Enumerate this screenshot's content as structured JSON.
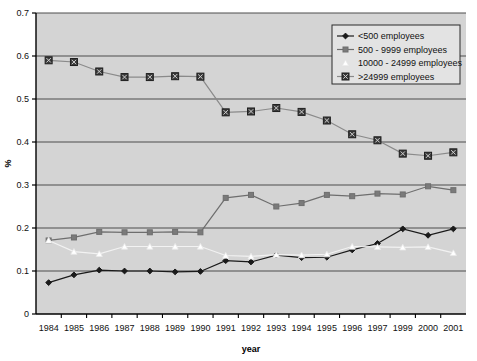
{
  "chart_data": {
    "type": "line",
    "title": "",
    "xlabel": "year",
    "ylabel": "%",
    "categories": [
      "1984",
      "1985",
      "1986",
      "1987",
      "1988",
      "1989",
      "1990",
      "1991",
      "1992",
      "1993",
      "1994",
      "1995",
      "1996",
      "1997",
      "1999",
      "2000",
      "2001"
    ],
    "xlim": [
      0,
      16
    ],
    "ylim": [
      0,
      0.7
    ],
    "yticks": [
      "0",
      "0.1",
      "0.2",
      "0.3",
      "0.4",
      "0.5",
      "0.6",
      "0.7"
    ],
    "ytick_values": [
      0,
      0.1,
      0.2,
      0.3,
      0.4,
      0.5,
      0.6,
      0.7
    ],
    "grid": "horizontal",
    "legend_position": "top-right",
    "plot_background": "#d4d4d4",
    "series": [
      {
        "name": "<500 employees",
        "marker": "diamond",
        "color": "#1a1a1a",
        "marker_fill": "#1a1a1a",
        "values": [
          0.073,
          0.091,
          0.102,
          0.1,
          0.1,
          0.098,
          0.099,
          0.124,
          0.121,
          0.137,
          0.131,
          0.132,
          0.149,
          0.164,
          0.198,
          0.183,
          0.198
        ]
      },
      {
        "name": "500 - 9999 employees",
        "marker": "square",
        "color": "#6e6e6e",
        "marker_fill": "#7a7a7a",
        "values": [
          0.171,
          0.178,
          0.191,
          0.19,
          0.19,
          0.191,
          0.19,
          0.27,
          0.277,
          0.25,
          0.258,
          0.277,
          0.274,
          0.28,
          0.278,
          0.297,
          0.288
        ]
      },
      {
        "name": "10000 - 24999 employees",
        "marker": "triangle",
        "color": "#f2f2f2",
        "marker_fill": "#ffffff",
        "values": [
          0.171,
          0.145,
          0.14,
          0.157,
          0.157,
          0.157,
          0.157,
          0.136,
          0.134,
          0.138,
          0.137,
          0.139,
          0.157,
          0.156,
          0.155,
          0.156,
          0.142
        ]
      },
      {
        "name": ">24999 employees",
        "marker": "square-x",
        "color": "#8a8a8a",
        "marker_fill": "#3a3a3a",
        "values": [
          0.59,
          0.586,
          0.564,
          0.551,
          0.551,
          0.553,
          0.552,
          0.469,
          0.471,
          0.479,
          0.47,
          0.45,
          0.418,
          0.404,
          0.373,
          0.368,
          0.376
        ]
      }
    ]
  },
  "legend": {
    "items": [
      {
        "label": "<500 employees"
      },
      {
        "label": "500 - 9999 employees"
      },
      {
        "label": "10000 - 24999 employees"
      },
      {
        "label": ">24999 employees"
      }
    ]
  }
}
